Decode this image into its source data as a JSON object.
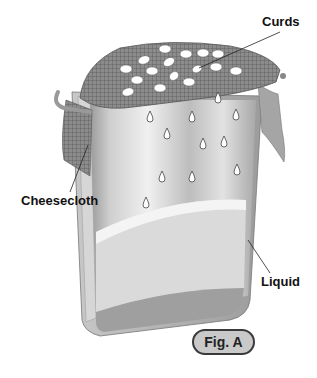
{
  "figure": {
    "badge": "Fig. A",
    "labels": {
      "curds": "Curds",
      "cheesecloth": "Cheesecloth",
      "liquid": "Liquid"
    },
    "parts": [
      "container",
      "cheesecloth",
      "curds",
      "drips",
      "liquid"
    ]
  },
  "colors": {
    "container_light": "#e6e6e6",
    "container_mid": "#b4b4b4",
    "container_dark": "#8a8a8a",
    "liquid_top": "#d8d8d8",
    "liquid_bottom": "#9d9d9d",
    "cheesecloth": "#7a7a7a",
    "curd": "#ffffff",
    "badge_fill": "#c9c9c9"
  }
}
